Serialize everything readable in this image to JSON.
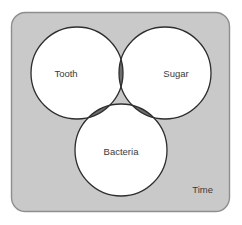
{
  "diagram": {
    "type": "venn-3",
    "title_label": "Time",
    "panel": {
      "fill": "#c9c9c9",
      "stroke": "#8e8e8e",
      "x": 11,
      "y": 12,
      "width": 219,
      "height": 200,
      "corner_radius": 14
    },
    "sets": [
      {
        "id": "tooth",
        "label": "Tooth",
        "cx": 77,
        "cy": 73,
        "r": 46,
        "fill": "#ffffff",
        "stroke": "#2e2e2e",
        "label_x": 66,
        "label_y": 74
      },
      {
        "id": "sugar",
        "label": "Sugar",
        "cx": 165,
        "cy": 73,
        "r": 46,
        "fill": "#ffffff",
        "stroke": "#2e2e2e",
        "label_x": 176,
        "label_y": 74
      },
      {
        "id": "bacteria",
        "label": "Bacteria",
        "cx": 121,
        "cy": 150,
        "r": 46,
        "fill": "#ffffff",
        "stroke": "#2e2e2e",
        "label_x": 121,
        "label_y": 152
      }
    ],
    "overlaps": {
      "pairwise_fill": "#6e6e6e",
      "triple_fill": "#333333",
      "stroke": "#2e2e2e"
    },
    "frame_label_position": {
      "x": 213,
      "y": 190
    }
  }
}
